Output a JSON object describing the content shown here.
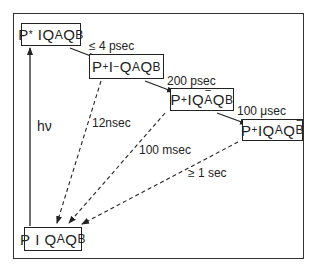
{
  "diagram": {
    "states": [
      {
        "id": "s1",
        "label": "P*IQAQB",
        "parts": {
          "p": "P",
          "p_sup": "*",
          "i": "I",
          "i_sup": "",
          "qa": "Q",
          "qa_sub": "A",
          "qa_sup": "",
          "qb": "Q",
          "qb_sub": "B",
          "qb_sup": ""
        }
      },
      {
        "id": "s2",
        "label": "P+I−QAQB",
        "parts": {
          "p": "P",
          "p_sup": "+",
          "i": "I",
          "i_sup": "−",
          "qa": "Q",
          "qa_sub": "A",
          "qa_sup": "",
          "qb": "Q",
          "qb_sub": "B",
          "qb_sup": ""
        }
      },
      {
        "id": "s3",
        "label": "P+IQA−QB",
        "parts": {
          "p": "P",
          "p_sup": "+",
          "i": "I",
          "i_sup": "",
          "qa": "Q",
          "qa_sub": "A",
          "qa_sup": "−",
          "qb": "Q",
          "qb_sub": "B",
          "qb_sup": ""
        }
      },
      {
        "id": "s4",
        "label": "P+IQAQB−",
        "parts": {
          "p": "P",
          "p_sup": "+",
          "i": "I",
          "i_sup": "",
          "qa": "Q",
          "qa_sub": "A",
          "qa_sup": "",
          "qb": "Q",
          "qb_sub": "B",
          "qb_sup": "−"
        }
      },
      {
        "id": "s5",
        "label": "PIQAQB",
        "parts": {
          "p": "P",
          "p_sup": "",
          "i": "I",
          "i_sup": "",
          "qa": "Q",
          "qa_sub": "A",
          "qa_sup": "",
          "qb": "Q",
          "qb_sub": "B",
          "qb_sup": ""
        }
      }
    ],
    "forward_times": [
      "≤ 4 psec",
      "200 psec",
      "100 μsec"
    ],
    "recombination_times": [
      "12nsec",
      "100 msec",
      "≥ 1 sec"
    ],
    "excitation_label": "hν"
  }
}
